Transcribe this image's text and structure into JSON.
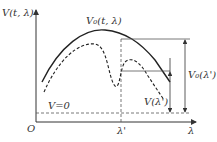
{
  "diagram": {
    "y_axis_label": "V(t, λ)",
    "x_axis_label": "λ",
    "origin_label": "O",
    "curve_solid_label": "V₀(t, λ)",
    "baseline_label": "V=0",
    "marker_label": "λ'",
    "v_prime_label": "V(λ')",
    "v0_prime_label": "V₀(λ')",
    "colors": {
      "line": "#333333",
      "background": "#ffffff"
    }
  }
}
